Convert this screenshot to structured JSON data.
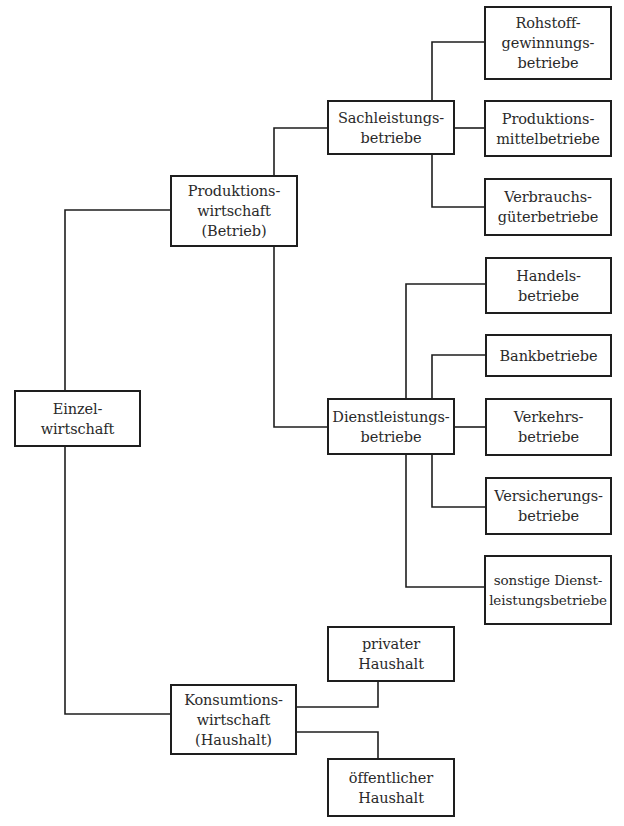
{
  "diagram": {
    "root": {
      "lines": [
        "Einzel-",
        "wirtschaft"
      ]
    },
    "produktion": {
      "lines": [
        "Produktions-",
        "wirtschaft",
        "(Betrieb)"
      ]
    },
    "konsumtion": {
      "lines": [
        "Konsumtions-",
        "wirtschaft",
        "(Haushalt)"
      ]
    },
    "sach": {
      "lines": [
        "Sachleistungs-",
        "betriebe"
      ]
    },
    "dienst": {
      "lines": [
        "Dienstleistungs-",
        "betriebe"
      ]
    },
    "rohstoff": {
      "lines": [
        "Rohstoff-",
        "gewinnungs-",
        "betriebe"
      ]
    },
    "produktionsmittel": {
      "lines": [
        "Produktions-",
        "mittelbetriebe"
      ]
    },
    "verbrauchs": {
      "lines": [
        "Verbrauchs-",
        "güterbetriebe"
      ]
    },
    "handels": {
      "lines": [
        "Handels-",
        "betriebe"
      ]
    },
    "bank": {
      "lines": [
        "Bankbetriebe"
      ]
    },
    "verkehrs": {
      "lines": [
        "Verkehrs-",
        "betriebe"
      ]
    },
    "versicherungs": {
      "lines": [
        "Versicherungs-",
        "betriebe"
      ]
    },
    "sonstige": {
      "lines": [
        "sonstige Dienst-",
        "leistungsbetriebe"
      ]
    },
    "privat": {
      "lines": [
        "privater",
        "Haushalt"
      ]
    },
    "oeffentlich": {
      "lines": [
        "öffentlicher",
        "Haushalt"
      ]
    }
  },
  "colors": {
    "line": "#1e1e1e",
    "text": "#2a2a2a",
    "background": "#ffffff"
  }
}
